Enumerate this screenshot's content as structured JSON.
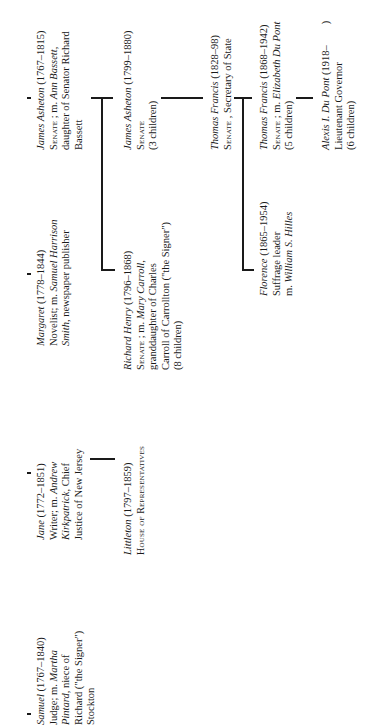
{
  "diagram": {
    "type": "family-tree",
    "orientation": "rotated-90-ccw",
    "generations": [
      {
        "members": [
          {
            "id": "samuel",
            "name": "Samuel",
            "dates": "(1767–1840)",
            "line2_prefix": "Judge; m. ",
            "spouse": "Martha",
            "line3_spouse": "Pintard",
            "line3_rest": ", niece of",
            "line4": "Richard (\"the Signer\")",
            "line5": "Stockton"
          },
          {
            "id": "jane",
            "name": "Jane",
            "dates": "(1772–1851)",
            "line2_prefix": "Writer; m. ",
            "spouse": "Andrew",
            "line3_spouse": "Kirkpatrick",
            "line3_rest": ", Chief",
            "line4": "Justice of New Jersey"
          },
          {
            "id": "margaret",
            "name": "Margaret",
            "dates": "(1778–1844)",
            "line2_prefix": "Novelist; m. ",
            "spouse": "Samuel Harrison",
            "line3_spouse": "Smith",
            "line3_rest": ", newspaper publisher"
          },
          {
            "id": "james-asheton-1",
            "name": "James Asheton",
            "dates": "(1767–1815)",
            "office": "Senate",
            "line2_rest": " ; m. ",
            "spouse": "Ann Bassett",
            "spouse_suffix": ",",
            "line3": "daughter of Senator Richard",
            "line4": "Bassett"
          }
        ]
      },
      {
        "members": [
          {
            "id": "littleton",
            "name": "Littleton",
            "dates": "(1797–1859)",
            "office": "House of Representatives"
          },
          {
            "id": "richard-henry",
            "name": "Richard Henry",
            "dates": "(1796–1868)",
            "office": "Senate",
            "line2_rest": " ; m. ",
            "spouse": "Mary Carroll",
            "spouse_suffix": ",",
            "line3": "granddaughter of Charles",
            "line4": "Carroll of Carrollton (\"the Signer\")",
            "line5": "(8 children)"
          },
          {
            "id": "james-asheton-2",
            "name": "James Asheton",
            "dates": "(1799–1880)",
            "office": "Senate",
            "line3": "(3 children)"
          }
        ]
      },
      {
        "members": [
          {
            "id": "thomas-francis-1",
            "name": "Thomas Francis",
            "dates": "(1828–98)",
            "office": "Senate",
            "line2_rest": " , Secretary of State"
          }
        ]
      },
      {
        "members": [
          {
            "id": "florence",
            "name": "Florence",
            "dates": "(1865–1954)",
            "line2": "Suffrage leader",
            "line3_prefix": "m. ",
            "spouse": "William S. Hilles"
          },
          {
            "id": "thomas-francis-2",
            "name": "Thomas Francis",
            "dates": "(1868–1942)",
            "office": "Senate",
            "line2_rest": " ; m. ",
            "spouse": "Elizabeth Du Pont",
            "line3": "(5 children)"
          }
        ]
      },
      {
        "members": [
          {
            "id": "alexis",
            "name": "Alexis I. Du Pont",
            "dates": "(1918–        )",
            "line2": "Lieutenant Governor",
            "line3": "(6 children)"
          }
        ]
      }
    ]
  }
}
